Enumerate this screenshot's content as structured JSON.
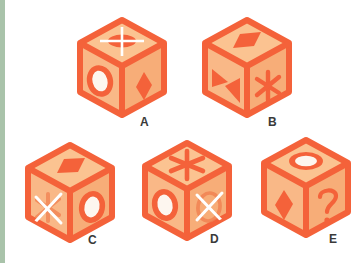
{
  "page": {
    "background_color": "#ffffff",
    "left_rail_color": "#a9c3aa"
  },
  "palette": {
    "edge": "#f4623a",
    "edge_dark": "#ef5a2e",
    "face_top": "#fbc391",
    "face_left": "#f9b887",
    "face_right": "#f7ad78",
    "symbol_fill": "#f4623a",
    "symbol_white": "#ffffff",
    "label_color": "#3a3a3a"
  },
  "cubes": [
    {
      "id": "cube-a",
      "label": "A",
      "faces": {
        "top": "ellipse-with-white-cross",
        "left": "white-ellipse-outline",
        "right": "filled-diamond"
      }
    },
    {
      "id": "cube-b",
      "label": "B",
      "faces": {
        "top": "filled-rhombus",
        "left": "bowtie-double-triangle",
        "right": "asterisk-star"
      }
    },
    {
      "id": "cube-c",
      "label": "C",
      "faces": {
        "top": "filled-rhombus",
        "left": "white-x-over-asterisk",
        "right": "white-ellipse-outline"
      }
    },
    {
      "id": "cube-d",
      "label": "D",
      "faces": {
        "top": "asterisk-star",
        "left": "white-ellipse-outline",
        "right": "white-x-over-ellipse"
      }
    },
    {
      "id": "cube-e",
      "label": "E",
      "faces": {
        "top": "white-ellipse-outline",
        "left": "filled-diamond",
        "right": "question-mark"
      }
    }
  ],
  "labels": {
    "a": "A",
    "b": "B",
    "c": "C",
    "d": "D",
    "e": "E"
  }
}
